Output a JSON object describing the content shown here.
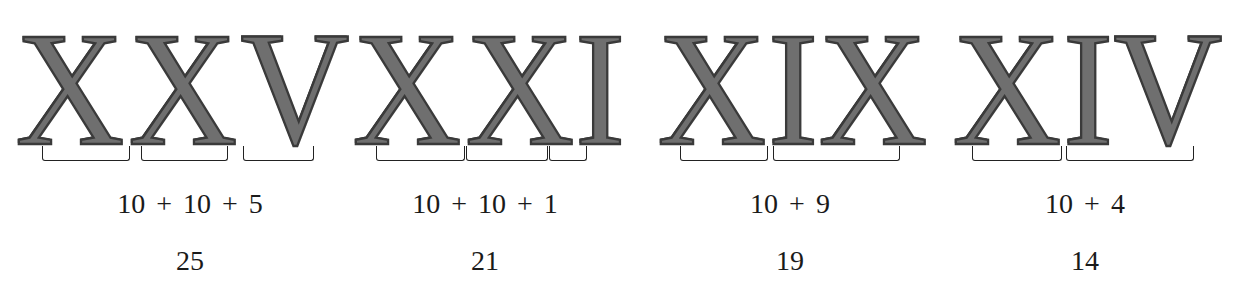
{
  "figure": {
    "groups": [
      {
        "numeral": "XXV",
        "letters": [
          "X",
          "X",
          "V"
        ],
        "parts": [
          "X",
          "X",
          "V"
        ],
        "equation": "10 + 10 + 5",
        "result": "25"
      },
      {
        "numeral": "XXI",
        "letters": [
          "X",
          "X",
          "I"
        ],
        "parts": [
          "X",
          "X",
          "I"
        ],
        "equation": "10 + 10 + 1",
        "result": "21"
      },
      {
        "numeral": "XIX",
        "letters": [
          "X",
          "I",
          "X"
        ],
        "parts": [
          "X",
          "IX"
        ],
        "equation": "10 + 9",
        "result": "19"
      },
      {
        "numeral": "XIV",
        "letters": [
          "X",
          "I",
          "V"
        ],
        "parts": [
          "X",
          "IV"
        ],
        "equation": "10 + 4",
        "result": "14"
      }
    ]
  }
}
